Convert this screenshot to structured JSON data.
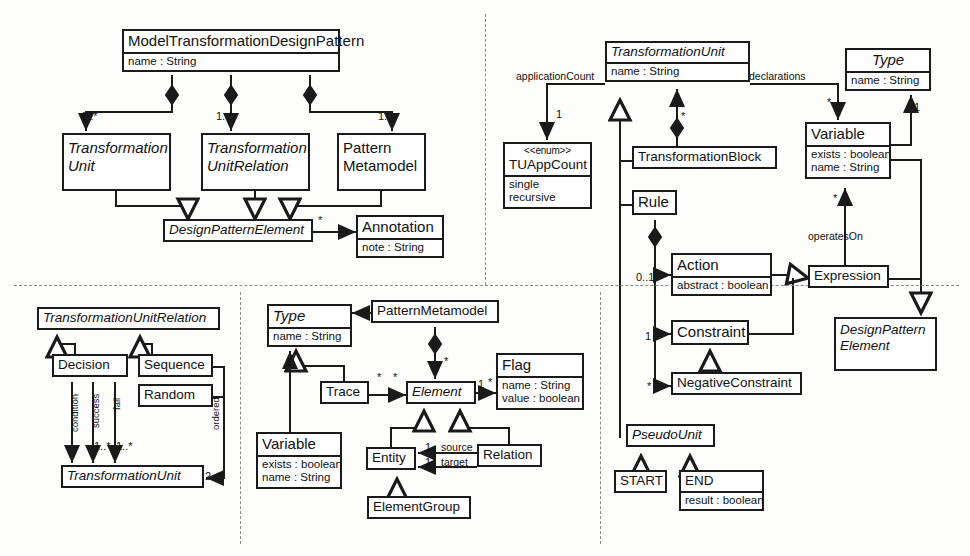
{
  "diagram": {
    "type": "uml-class-diagram",
    "quadrants": [
      {
        "id": "top-left",
        "topic": "Model Transformation Design Pattern structure"
      },
      {
        "id": "top-right",
        "topic": "Transformation Unit structure"
      },
      {
        "id": "bottom-left",
        "topic": "Transformation Unit Relation structure"
      },
      {
        "id": "bottom-middle",
        "topic": "Pattern Metamodel structure"
      }
    ],
    "classes": [
      {
        "id": "model-transformation-design-pattern",
        "name": "ModelTransformationDesignPattern",
        "italic": false,
        "attributes": [
          "name : String"
        ],
        "x": 122,
        "y": 29,
        "w": 218,
        "h": 46
      },
      {
        "id": "transformation-unit-tl",
        "name": "Transformation\nUnit",
        "name_lines": [
          "Transformation",
          "Unit"
        ],
        "italic": true,
        "attributes": [],
        "x": 62,
        "y": 133,
        "w": 109,
        "h": 58
      },
      {
        "id": "transformation-unit-relation-tl",
        "name_lines": [
          "Transformation",
          "UnitRelation"
        ],
        "italic": true,
        "attributes": [],
        "x": 201,
        "y": 133,
        "w": 109,
        "h": 58
      },
      {
        "id": "pattern-metamodel-tl",
        "name_lines": [
          "Pattern",
          "Metamodel"
        ],
        "italic": false,
        "attributes": [],
        "x": 337,
        "y": 133,
        "w": 89,
        "h": 58
      },
      {
        "id": "design-pattern-element",
        "name_lines": [
          "DesignPatternElement"
        ],
        "italic": true,
        "attributes": [],
        "x": 163,
        "y": 219,
        "w": 150,
        "h": 27
      },
      {
        "id": "annotation",
        "name_lines": [
          "Annotation"
        ],
        "italic": false,
        "attributes": [
          "note : String"
        ],
        "x": 356,
        "y": 215,
        "w": 88,
        "h": 46
      },
      {
        "id": "transformation-unit-main",
        "name_lines": [
          "TransformationUnit"
        ],
        "italic": true,
        "attributes": [
          "name : String"
        ],
        "x": 605,
        "y": 41,
        "w": 145,
        "h": 46
      },
      {
        "id": "tuappcount",
        "stereotype": "<<enum>>",
        "name_lines": [
          "TUAppCount"
        ],
        "italic": false,
        "attributes": [
          "single",
          "recursive"
        ],
        "x": 503,
        "y": 142,
        "w": 89,
        "h": 94
      },
      {
        "id": "transformation-block",
        "name_lines": [
          "TransformationBlock"
        ],
        "italic": false,
        "attributes": [],
        "x": 632,
        "y": 146,
        "w": 145,
        "h": 30
      },
      {
        "id": "rule",
        "name_lines": [
          "Rule"
        ],
        "italic": false,
        "attributes": [],
        "x": 632,
        "y": 190,
        "w": 45,
        "h": 30
      },
      {
        "id": "action",
        "name_lines": [
          "Action"
        ],
        "italic": false,
        "attributes": [
          "abstract : boolean"
        ],
        "x": 671,
        "y": 253,
        "w": 101,
        "h": 44
      },
      {
        "id": "constraint",
        "name_lines": [
          "Constraint"
        ],
        "italic": false,
        "attributes": [],
        "x": 671,
        "y": 320,
        "w": 78,
        "h": 28
      },
      {
        "id": "negative-constraint",
        "name_lines": [
          "NegativeConstraint"
        ],
        "italic": false,
        "attributes": [],
        "x": 671,
        "y": 372,
        "w": 131,
        "h": 28
      },
      {
        "id": "type-tr",
        "name_lines": [
          "Type"
        ],
        "italic": true,
        "attributes": [
          "name : String"
        ],
        "x": 845,
        "y": 48,
        "w": 86,
        "h": 44
      },
      {
        "id": "variable-tr",
        "name_lines": [
          "Variable"
        ],
        "italic": false,
        "attributes": [
          "exists : boolean",
          "name : String"
        ],
        "x": 805,
        "y": 122,
        "w": 86,
        "h": 62
      },
      {
        "id": "expression",
        "name_lines": [
          "Expression"
        ],
        "italic": false,
        "attributes": [],
        "x": 808,
        "y": 265,
        "w": 81,
        "h": 28
      },
      {
        "id": "design-pattern-element-2",
        "name_lines": [
          "DesignPattern",
          "Element"
        ],
        "italic": true,
        "attributes": [],
        "x": 834,
        "y": 317,
        "w": 103,
        "h": 54
      },
      {
        "id": "pseudo-unit",
        "name_lines": [
          "PseudoUnit"
        ],
        "italic": true,
        "attributes": [],
        "x": 626,
        "y": 424,
        "w": 89,
        "h": 27
      },
      {
        "id": "start",
        "name_lines": [
          "START"
        ],
        "italic": false,
        "attributes": [],
        "x": 614,
        "y": 470,
        "w": 53,
        "h": 27
      },
      {
        "id": "end",
        "name_lines": [
          "END"
        ],
        "italic": false,
        "attributes": [
          "result : boolean"
        ],
        "x": 679,
        "y": 470,
        "w": 85,
        "h": 46
      },
      {
        "id": "transformation-unit-relation-bl",
        "name_lines": [
          "TransformationUnitRelation"
        ],
        "italic": true,
        "attributes": [],
        "x": 37,
        "y": 307,
        "w": 183,
        "h": 26
      },
      {
        "id": "decision",
        "name_lines": [
          "Decision"
        ],
        "italic": false,
        "attributes": [],
        "x": 52,
        "y": 354,
        "w": 76,
        "h": 28
      },
      {
        "id": "sequence",
        "name_lines": [
          "Sequence"
        ],
        "italic": false,
        "attributes": [],
        "x": 138,
        "y": 354,
        "w": 75,
        "h": 27
      },
      {
        "id": "random",
        "name_lines": [
          "Random"
        ],
        "italic": false,
        "attributes": [],
        "x": 138,
        "y": 384,
        "w": 75,
        "h": 27
      },
      {
        "id": "transformation-unit-bl",
        "name_lines": [
          "TransformationUnit"
        ],
        "italic": true,
        "attributes": [],
        "x": 61,
        "y": 465,
        "w": 143,
        "h": 27
      },
      {
        "id": "type-bm",
        "name_lines": [
          "Type"
        ],
        "italic": true,
        "attributes": [
          "name : String"
        ],
        "x": 267,
        "y": 304,
        "w": 85,
        "h": 45
      },
      {
        "id": "pattern-metamodel-bm",
        "name_lines": [
          "PatternMetamodel"
        ],
        "italic": false,
        "attributes": [],
        "x": 371,
        "y": 300,
        "w": 128,
        "h": 27
      },
      {
        "id": "trace",
        "name_lines": [
          "Trace"
        ],
        "italic": false,
        "attributes": [],
        "x": 320,
        "y": 381,
        "w": 49,
        "h": 28
      },
      {
        "id": "element",
        "name_lines": [
          "Element"
        ],
        "italic": true,
        "attributes": [],
        "x": 406,
        "y": 381,
        "w": 70,
        "h": 28
      },
      {
        "id": "flag",
        "name_lines": [
          "Flag"
        ],
        "italic": false,
        "attributes": [
          "name : String",
          "value : boolean"
        ],
        "x": 496,
        "y": 353,
        "w": 88,
        "h": 62
      },
      {
        "id": "variable-bm",
        "name_lines": [
          "Variable"
        ],
        "italic": false,
        "attributes": [
          "exists : boolean",
          "name : String"
        ],
        "x": 256,
        "y": 432,
        "w": 86,
        "h": 62
      },
      {
        "id": "entity",
        "name_lines": [
          "Entity"
        ],
        "italic": false,
        "attributes": [],
        "x": 366,
        "y": 447,
        "w": 50,
        "h": 28
      },
      {
        "id": "relation",
        "name_lines": [
          "Relation"
        ],
        "italic": false,
        "attributes": [],
        "x": 477,
        "y": 444,
        "w": 65,
        "h": 28
      },
      {
        "id": "element-group",
        "name_lines": [
          "ElementGroup"
        ],
        "italic": false,
        "attributes": [],
        "x": 367,
        "y": 496,
        "w": 104,
        "h": 28
      }
    ],
    "edge_labels": [
      {
        "id": "mult-tu-tl",
        "text": "1..*",
        "x": 81,
        "y": 110
      },
      {
        "id": "mult-tur-tl",
        "text": "1..*",
        "x": 216,
        "y": 110
      },
      {
        "id": "mult-pm-tl",
        "text": "1..*",
        "x": 378,
        "y": 110
      },
      {
        "id": "mult-dpe-annotation",
        "text": "*",
        "x": 318,
        "y": 218
      },
      {
        "id": "label-application-count",
        "text": "applicationCount",
        "x": 516,
        "y": 70
      },
      {
        "id": "mult-tuappcount",
        "text": "1",
        "x": 556,
        "y": 111
      },
      {
        "id": "label-declarations",
        "text": "declarations",
        "x": 749,
        "y": 70
      },
      {
        "id": "mult-declarations",
        "text": "*",
        "x": 827,
        "y": 99
      },
      {
        "id": "mult-transformation-block",
        "text": "*",
        "x": 681,
        "y": 112
      },
      {
        "id": "mult-action",
        "text": "0..1",
        "x": 639,
        "y": 271
      },
      {
        "id": "mult-constraint",
        "text": "1",
        "x": 645,
        "y": 330
      },
      {
        "id": "mult-negative-constraint",
        "text": "*",
        "x": 647,
        "y": 383
      },
      {
        "id": "mult-type-variable",
        "text": "1",
        "x": 915,
        "y": 105
      },
      {
        "id": "label-operates-on",
        "text": "operatesOn",
        "x": 810,
        "y": 237
      },
      {
        "id": "mult-operates-on",
        "text": "*",
        "x": 833,
        "y": 196
      },
      {
        "id": "label-condition",
        "text": "condition",
        "x": 69,
        "y": 430,
        "vertical": true
      },
      {
        "id": "label-success",
        "text": "success",
        "x": 90,
        "y": 425,
        "vertical": true
      },
      {
        "id": "label-fail",
        "text": "fail",
        "x": 111,
        "y": 408,
        "vertical": true
      },
      {
        "id": "mult-success",
        "text": "1..*",
        "x": 92,
        "y": 443
      },
      {
        "id": "mult-fail",
        "text": "1..*",
        "x": 114,
        "y": 443
      },
      {
        "id": "label-ordered",
        "text": "ordered",
        "x": 207,
        "y": 425,
        "vertical": true
      },
      {
        "id": "mult-ordered",
        "text": "2..*",
        "x": 206,
        "y": 470
      },
      {
        "id": "mult-trace-type",
        "text": "1",
        "x": 287,
        "y": 360
      },
      {
        "id": "mult-pm-element",
        "text": "*",
        "x": 446,
        "y": 357
      },
      {
        "id": "mult-trace-left",
        "text": "*",
        "x": 378,
        "y": 374
      },
      {
        "id": "mult-trace-right",
        "text": "*",
        "x": 393,
        "y": 374
      },
      {
        "id": "mult-element-flag-1",
        "text": "1",
        "x": 478,
        "y": 381
      },
      {
        "id": "mult-element-flag-2",
        "text": "*",
        "x": 488,
        "y": 379
      },
      {
        "id": "mult-source",
        "text": "1",
        "x": 425,
        "y": 443
      },
      {
        "id": "label-source",
        "text": "source",
        "x": 440,
        "y": 443
      },
      {
        "id": "mult-target",
        "text": "1",
        "x": 425,
        "y": 458
      },
      {
        "id": "label-target",
        "text": "target",
        "x": 440,
        "y": 458
      }
    ],
    "dividers": [
      {
        "id": "divider-horizontal",
        "orientation": "h",
        "x": 14,
        "y": 285,
        "len": 945
      },
      {
        "id": "divider-vertical-top",
        "orientation": "v",
        "x": 485,
        "y": 14,
        "len": 271
      },
      {
        "id": "divider-vertical-bottom-left",
        "orientation": "v",
        "x": 240,
        "y": 292,
        "len": 252
      },
      {
        "id": "divider-vertical-bottom-right",
        "orientation": "v",
        "x": 600,
        "y": 292,
        "len": 252
      }
    ],
    "colors": {
      "stroke": "#1a1a1a",
      "fill": "#ffffff",
      "divider": "#8a8a8a",
      "background": "#fdfdfb"
    }
  }
}
